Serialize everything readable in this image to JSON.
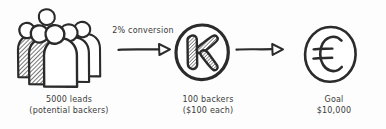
{
  "diagram": {
    "type": "flow",
    "background_color": "#fdfdfd",
    "ink_color": "#2b2b2b",
    "style": "hand-drawn sketch"
  },
  "stages": {
    "leads": {
      "icon": "people-group-icon",
      "figure_count": 5,
      "label_line1": "5000 leads",
      "label_line2": "(potential backers)"
    },
    "backers": {
      "icon": "kickstarter-k-icon",
      "label_line1": "100 backers",
      "label_line2": "($100 each)"
    },
    "goal": {
      "icon": "euro-coin-icon",
      "label_line1": "Goal",
      "label_line2": "$10,000"
    }
  },
  "connectors": {
    "arrow1": {
      "icon": "arrow-right-icon",
      "label": "2% conversion"
    },
    "arrow2": {
      "icon": "arrow-right-icon",
      "label": ""
    }
  }
}
